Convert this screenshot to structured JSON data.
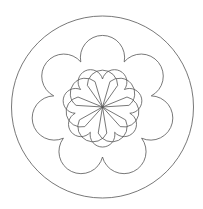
{
  "diagram": {
    "type": "mandala",
    "symmetry": 7,
    "stroke_color": "#555555",
    "background": "#ffffff",
    "center": [
      102.5,
      107
    ],
    "outer_circle_radius": 91,
    "rings": [
      {
        "name": "inner-petals",
        "count": 7,
        "shape": "teardrop",
        "tip_radius": 0,
        "outer_radius": 45,
        "rotation_deg": 0
      },
      {
        "name": "middle-petals",
        "count": 7,
        "shape": "scallop",
        "base_radius": 28,
        "outer_radius": 66,
        "rotation_deg": 180
      },
      {
        "name": "outer-petals",
        "count": 7,
        "shape": "scallop",
        "base_radius": 50,
        "outer_radius": 91,
        "rotation_deg": 0
      }
    ]
  }
}
